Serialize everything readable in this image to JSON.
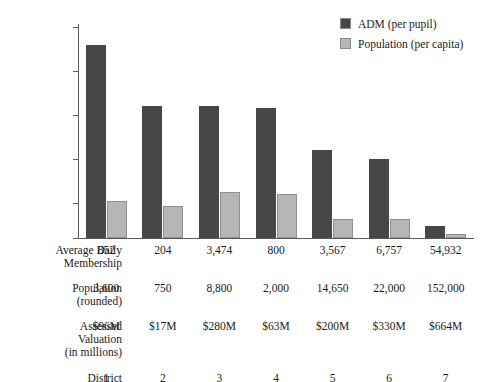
{
  "chart_data": {
    "type": "bar",
    "title": "",
    "subtitle": "",
    "xlabel": "District",
    "ylabel": "",
    "grid": false,
    "legend_position": "top-right",
    "categories": [
      "1",
      "2",
      "3",
      "4",
      "5",
      "6",
      "7"
    ],
    "yticks": [
      "$5,000",
      "$25,000",
      "$50,000",
      "$75,000",
      "$100,000",
      "$125,000"
    ],
    "ytick_values": [
      5000,
      25000,
      50000,
      75000,
      100000,
      125000
    ],
    "ylim": [
      5000,
      125000
    ],
    "series": [
      {
        "name": "ADM (per pupil)",
        "color": "#474747",
        "values": [
          115000,
          80000,
          80000,
          79000,
          55000,
          50000,
          12000
        ]
      },
      {
        "name": "Population (per capita)",
        "color": "#b6b6b6",
        "values": [
          26000,
          23000,
          31000,
          30000,
          16000,
          16000,
          7000
        ]
      }
    ],
    "table": {
      "rows": [
        {
          "label": "Average Daily\nMembership",
          "values": [
            "852",
            "204",
            "3,474",
            "800",
            "3,567",
            "6,757",
            "54,932"
          ]
        },
        {
          "label": "Population\n(rounded)",
          "values": [
            "3,600",
            "750",
            "8,800",
            "2,000",
            "14,650",
            "22,000",
            "152,000"
          ]
        },
        {
          "label": "Assessed\nValuation\n(in millions)",
          "values": [
            "$96M",
            "$17M",
            "$280M",
            "$63M",
            "$200M",
            "$330M",
            "$664M"
          ]
        },
        {
          "label": "District",
          "values": [
            "1",
            "2",
            "3",
            "4",
            "5",
            "6",
            "7"
          ]
        }
      ]
    }
  },
  "legend": {
    "items": [
      {
        "label": "ADM (per pupil)",
        "color": "#474747"
      },
      {
        "label": "Population (per capita)",
        "color": "#b6b6b6"
      }
    ]
  }
}
